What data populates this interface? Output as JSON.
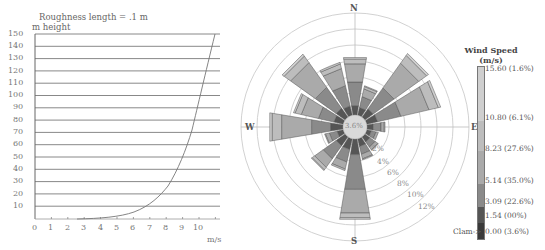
{
  "chart_data": [
    {
      "type": "line",
      "title": "Roughness length = .1 m",
      "ylabel": "m height",
      "xlabel": "m/s",
      "xlim": [
        0,
        11
      ],
      "ylim": [
        0,
        150
      ],
      "x_ticks": [
        "0",
        "1",
        "2",
        "3",
        "4",
        "5",
        "6",
        "7",
        "8",
        "9",
        "10"
      ],
      "y_ticks": [
        "10",
        "20",
        "30",
        "40",
        "50",
        "60",
        "70",
        "80",
        "90",
        "100",
        "110",
        "120",
        "130",
        "140",
        "150"
      ],
      "grid": "horizontal",
      "series": [
        {
          "name": "wind profile",
          "x": [
            2.6,
            3.0,
            4.0,
            5.0,
            6.0,
            6.5,
            7.0,
            7.5,
            8.0,
            8.5,
            9.0,
            9.4,
            9.7,
            10.0,
            10.3,
            10.6
          ],
          "y": [
            0.2,
            0.4,
            1.2,
            3,
            6,
            9,
            13,
            18,
            26,
            37,
            52,
            68,
            82,
            100,
            122,
            148
          ]
        }
      ]
    },
    {
      "type": "wind-rose",
      "title": "",
      "directions": [
        "N",
        "NNE",
        "NE",
        "ENE",
        "E",
        "ESE",
        "SE",
        "SSE",
        "S",
        "SSW",
        "SW",
        "WSW",
        "W",
        "WNW",
        "NW",
        "NNW"
      ],
      "compass_labels": [
        "N",
        "E",
        "S",
        "W"
      ],
      "radial_ticks": [
        "2%",
        "4%",
        "6%",
        "8%",
        "10%",
        "12%"
      ],
      "calm_center_label": "3.6%",
      "speed_bins": [
        "0.00-1.54",
        "1.54-3.09",
        "3.09-5.14",
        "5.14-8.23",
        "8.23-10.80",
        "10.80-15.60",
        ">15.60"
      ],
      "frequencies_pct": [
        [
          0.0,
          0.0,
          1.2,
          3.0,
          2.3,
          0.6,
          0.2
        ],
        [
          0.0,
          0.0,
          1.0,
          1.4,
          1.0,
          0.3,
          0.1
        ],
        [
          0.0,
          0.0,
          1.3,
          3.2,
          3.8,
          1.2,
          0.3
        ],
        [
          0.0,
          0.0,
          1.4,
          3.0,
          3.6,
          1.2,
          0.3
        ],
        [
          0.0,
          0.0,
          0.8,
          1.0,
          0.4,
          0.1,
          0.0
        ],
        [
          0.0,
          0.0,
          0.6,
          0.6,
          0.3,
          0.0,
          0.0
        ],
        [
          0.0,
          0.0,
          0.8,
          0.8,
          0.4,
          0.1,
          0.0
        ],
        [
          0.0,
          0.0,
          1.0,
          1.0,
          0.6,
          0.1,
          0.0
        ],
        [
          0.0,
          0.0,
          2.0,
          4.4,
          3.0,
          0.6,
          0.2
        ],
        [
          0.0,
          0.0,
          1.4,
          1.6,
          0.9,
          0.2,
          0.0
        ],
        [
          0.0,
          0.0,
          1.4,
          2.0,
          1.3,
          0.4,
          0.1
        ],
        [
          0.0,
          0.0,
          0.8,
          1.0,
          0.5,
          0.1,
          0.0
        ],
        [
          0.0,
          0.0,
          1.6,
          2.4,
          3.8,
          1.2,
          0.3
        ],
        [
          0.0,
          0.0,
          1.2,
          2.0,
          2.2,
          0.8,
          0.2
        ],
        [
          0.0,
          0.0,
          1.4,
          3.2,
          3.8,
          1.0,
          0.3
        ],
        [
          0.0,
          0.0,
          1.2,
          2.6,
          2.2,
          0.6,
          0.2
        ]
      ],
      "legend": {
        "title_line1": "Wind Speed",
        "title_line2": "(m/s)",
        "entries": [
          {
            "label": "15.60 (1.6%)",
            "color": "#cfcfcf"
          },
          {
            "label": "10.80 (6.1%)",
            "color": "#bdbdbd"
          },
          {
            "label": "8.23 (27.6%)",
            "color": "#a9a9a9"
          },
          {
            "label": "5.14 (35.0%)",
            "color": "#8a8a8a"
          },
          {
            "label": "3.09 (22.6%)",
            "color": "#555555"
          },
          {
            "label": "1.54 (00%)",
            "color": "#3a3a3a"
          },
          {
            "label": "0.00 (3.6%)",
            "color": "#222222"
          }
        ],
        "calm_label": "Clam->"
      }
    }
  ],
  "left": {
    "title": "Roughness length = .1 m",
    "ylabel": "m height",
    "xunit": "m/s",
    "yticks": [
      "150",
      "140",
      "130",
      "120",
      "110",
      "100",
      "90",
      "80",
      "70",
      "60",
      "50",
      "40",
      "30",
      "20",
      "10"
    ],
    "xticks": [
      "0",
      "1",
      "2",
      "3",
      "4",
      "5",
      "6",
      "7",
      "8",
      "9",
      "10"
    ]
  },
  "rose": {
    "n": "N",
    "e": "E",
    "s": "S",
    "w": "W",
    "center": "3.6%",
    "rings": [
      "2%",
      "4%",
      "6%",
      "8%",
      "10%",
      "12%"
    ]
  },
  "legend": {
    "title1": "Wind Speed",
    "title2": "(m/s)",
    "l0": "15.60 (1.6%)",
    "l1": "10.80 (6.1%)",
    "l2": "8.23 (27.6%)",
    "l3": "5.14 (35.0%)",
    "l4": "3.09 (22.6%)",
    "l5": "1.54 (00%)",
    "l6": "0.00 (3.6%)",
    "calm": "Clam->"
  }
}
